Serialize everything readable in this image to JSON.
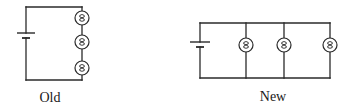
{
  "diagram": {
    "colors": {
      "wire": "#2a2a2a",
      "background": "#ffffff"
    },
    "circuits": [
      {
        "id": "old",
        "label": "Old",
        "configuration": "series",
        "label_pos": {
          "x": 50,
          "y": 90
        },
        "frame": {
          "left": 26,
          "right": 82,
          "top": 7,
          "bottom": 80
        },
        "battery": {
          "x": 26,
          "long_plate_y": 33,
          "long_half": 9,
          "short_plate_y": 38,
          "short_half": 4
        },
        "bulbs": [
          {
            "cx": 82,
            "cy": 18,
            "r": 7
          },
          {
            "cx": 82,
            "cy": 42,
            "r": 7
          },
          {
            "cx": 82,
            "cy": 68,
            "r": 7
          }
        ]
      },
      {
        "id": "new",
        "label": "New",
        "configuration": "parallel",
        "label_pos": {
          "x": 273,
          "y": 89
        },
        "frame": {
          "left": 200,
          "right": 330,
          "top": 23,
          "bottom": 78
        },
        "battery": {
          "x": 200,
          "long_plate_y": 42,
          "long_half": 10,
          "short_plate_y": 47,
          "short_half": 4
        },
        "branches_x": [
          246,
          284,
          330
        ],
        "bulbs": [
          {
            "cx": 246,
            "cy": 45,
            "r": 7
          },
          {
            "cx": 284,
            "cy": 45,
            "r": 7
          },
          {
            "cx": 330,
            "cy": 45,
            "r": 7
          }
        ]
      }
    ]
  }
}
